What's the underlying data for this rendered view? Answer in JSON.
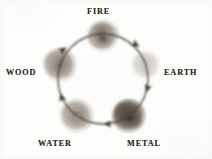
{
  "figure": {
    "kind": "cycle-diagram",
    "title": "",
    "background_color": "#fdfdfc",
    "stroke_color": "#4a443e",
    "label_color": "#2b2723"
  },
  "cycle": {
    "direction": "clockwise",
    "center": {
      "x": 103,
      "y": 79
    },
    "radius": 45,
    "order": [
      "WOOD",
      "FIRE",
      "EARTH",
      "METAL",
      "WATER"
    ]
  },
  "nodes": [
    {
      "id": "fire",
      "label": "FIRE",
      "angle_deg": -90,
      "cx": 103,
      "cy": 36,
      "r": 16,
      "core_color": "#6f6358",
      "mid_color": "#8d8276",
      "halo_color": "#b9b2a9",
      "opacity": 0.95,
      "label_x": 87,
      "label_y": 8,
      "label_align": "center"
    },
    {
      "id": "earth",
      "label": "EARTH",
      "angle_deg": -18,
      "cx": 146,
      "cy": 65,
      "r": 15,
      "core_color": "#c3bdb4",
      "mid_color": "#d3cec7",
      "halo_color": "#e6e3de",
      "opacity": 0.8,
      "label_x": 164,
      "label_y": 69,
      "label_align": "left"
    },
    {
      "id": "metal",
      "label": "METAL",
      "angle_deg": 54,
      "cx": 129,
      "cy": 116,
      "r": 17,
      "core_color": "#4c433b",
      "mid_color": "#6a5e53",
      "halo_color": "#8c8177",
      "opacity": 1,
      "label_x": 127,
      "label_y": 140,
      "label_align": "center"
    },
    {
      "id": "water",
      "label": "WATER",
      "angle_deg": 126,
      "cx": 77,
      "cy": 116,
      "r": 17,
      "core_color": "#8d8377",
      "mid_color": "#a49a8f",
      "halo_color": "#c5beb5",
      "opacity": 0.92,
      "label_x": 38,
      "label_y": 140,
      "label_align": "left"
    },
    {
      "id": "wood",
      "label": "WOOD",
      "angle_deg": -162,
      "cx": 60,
      "cy": 65,
      "r": 17,
      "core_color": "#82786d",
      "mid_color": "#9a9186",
      "halo_color": "#bdb6ad",
      "opacity": 0.95,
      "label_x": 6,
      "label_y": 69,
      "label_align": "left"
    }
  ],
  "arrows": [
    {
      "id": "wood-to-fire",
      "from": "WOOD",
      "to": "FIRE",
      "midpoint_angle_deg": -126,
      "tip_angle_deg": -126
    },
    {
      "id": "fire-to-earth",
      "from": "FIRE",
      "to": "EARTH",
      "midpoint_angle_deg": -54,
      "tip_angle_deg": -54
    },
    {
      "id": "earth-to-metal",
      "from": "EARTH",
      "to": "METAL",
      "midpoint_angle_deg": 18,
      "tip_angle_deg": 18
    },
    {
      "id": "metal-to-water",
      "from": "METAL",
      "to": "WATER",
      "midpoint_angle_deg": 90,
      "tip_angle_deg": 90
    },
    {
      "id": "water-to-wood",
      "from": "WATER",
      "to": "WOOD",
      "midpoint_angle_deg": 162,
      "tip_angle_deg": 162
    }
  ]
}
